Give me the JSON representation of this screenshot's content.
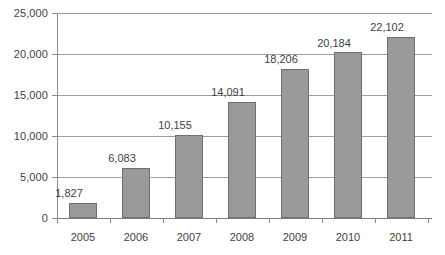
{
  "chart_data": {
    "type": "bar",
    "title": "",
    "subtitle": "",
    "xlabel": "",
    "ylabel": "",
    "categories": [
      "2005",
      "2006",
      "2007",
      "2008",
      "2009",
      "2010",
      "2011"
    ],
    "values": [
      1827,
      6083,
      10155,
      14091,
      18206,
      20184,
      22102
    ],
    "data_labels": [
      "1,827",
      "6,083",
      "10,155",
      "14,091",
      "18,206",
      "20,184",
      "22,102"
    ],
    "ylim": [
      0,
      25000
    ],
    "ytick_values": [
      0,
      5000,
      10000,
      15000,
      20000,
      25000
    ],
    "ytick_labels": [
      "0",
      "5,000",
      "10,000",
      "15,000",
      "20,000",
      "25,000"
    ],
    "grid": true,
    "legend": false,
    "series": [
      {
        "name": "",
        "values": [
          1827,
          6083,
          10155,
          14091,
          18206,
          20184,
          22102
        ]
      }
    ],
    "colors": {
      "bar_fill": "#9a9a9a",
      "bar_border": "#6f6f6f",
      "gridline": "#9d9d9d",
      "axis": "#8a8a8a",
      "text": "#3f3f3f",
      "background": "#ffffff"
    }
  }
}
